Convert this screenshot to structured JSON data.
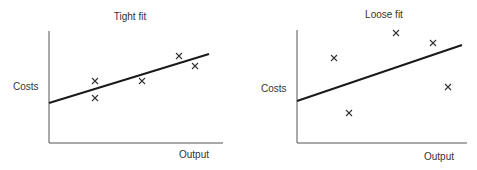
{
  "chart_data": [
    {
      "type": "scatter",
      "title": "Tight fit",
      "xlabel": "Output",
      "ylabel": "Costs",
      "grid": false,
      "legend": null,
      "marker": "x",
      "points": [
        {
          "x": 0.26,
          "y": 0.55
        },
        {
          "x": 0.26,
          "y": 0.4
        },
        {
          "x": 0.53,
          "y": 0.55
        },
        {
          "x": 0.75,
          "y": 0.78
        },
        {
          "x": 0.84,
          "y": 0.69
        }
      ],
      "trend_line": {
        "x": [
          0.0,
          0.92
        ],
        "y": [
          0.36,
          0.79
        ]
      },
      "frame": {
        "axis_x": 49,
        "axis_top": 31,
        "axis_bottom": 143,
        "axis_right": 223,
        "px": [
          [
            95,
            81
          ],
          [
            95,
            98
          ],
          [
            142,
            81
          ],
          [
            179,
            56
          ],
          [
            195,
            66
          ]
        ],
        "line": [
          49,
          103,
          209,
          54
        ],
        "title_pos": [
          130,
          20
        ],
        "xlabel_pos": [
          194,
          158
        ],
        "ylabel_pos": [
          13,
          90
        ]
      }
    },
    {
      "type": "scatter",
      "title": "Loose fit",
      "xlabel": "Output",
      "ylabel": "Costs",
      "grid": false,
      "legend": null,
      "marker": "x",
      "points": [
        {
          "x": 0.22,
          "y": 0.75
        },
        {
          "x": 0.31,
          "y": 0.27
        },
        {
          "x": 0.58,
          "y": 0.97
        },
        {
          "x": 0.8,
          "y": 0.88
        },
        {
          "x": 0.89,
          "y": 0.5
        }
      ],
      "trend_line": {
        "x": [
          0.0,
          0.97
        ],
        "y": [
          0.37,
          0.87
        ]
      },
      "frame": {
        "axis_x": 297,
        "axis_top": 30,
        "axis_bottom": 143,
        "axis_right": 467,
        "px": [
          [
            334,
            58
          ],
          [
            349,
            113
          ],
          [
            396,
            33
          ],
          [
            433,
            43
          ],
          [
            448,
            87
          ]
        ],
        "line": [
          297,
          101,
          462,
          45
        ],
        "title_pos": [
          384,
          18
        ],
        "xlabel_pos": [
          439,
          160
        ],
        "ylabel_pos": [
          261,
          92
        ]
      }
    }
  ]
}
